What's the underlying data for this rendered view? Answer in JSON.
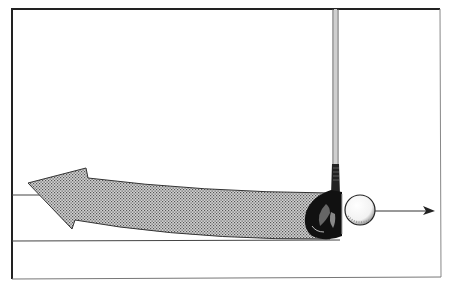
{
  "illustration": {
    "subject": "golf club head striking ball with backswing path arrow",
    "elements": {
      "frame": "frame",
      "shaft": "club-shaft",
      "clubhead": "wood-clubhead",
      "ball": "golf-ball",
      "ball_direction_arrow": "right-arrow",
      "swing_path_arrow": "curved-left-arrow",
      "ground_line": "ground-line",
      "target_line": "target-line"
    },
    "colors": {
      "background": "#ffffff",
      "ink": "#111111",
      "stipple": "#9a9a9a",
      "frame": "#222222"
    }
  }
}
